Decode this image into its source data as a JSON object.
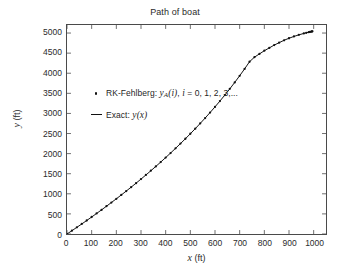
{
  "chart_data": {
    "type": "line",
    "title": "Path of boat",
    "xlabel": "x (ft)",
    "ylabel": "y (ft)",
    "xlabel_var": "x",
    "xlabel_unit": "(ft)",
    "ylabel_var": "y",
    "ylabel_unit": "(ft)",
    "xlim": [
      0,
      1050
    ],
    "ylim": [
      0,
      5200
    ],
    "grid": false,
    "legend_position": "center-left",
    "xticks": [
      0,
      100,
      200,
      300,
      400,
      500,
      600,
      700,
      800,
      900,
      1000
    ],
    "yticks": [
      0,
      500,
      1000,
      1500,
      2000,
      2500,
      3000,
      3500,
      4000,
      4500,
      5000
    ],
    "xtick_labels": [
      "0",
      "100",
      "200",
      "300",
      "400",
      "500",
      "600",
      "700",
      "800",
      "900",
      "1000"
    ],
    "ytick_labels": [
      "0",
      "500",
      "1000",
      "1500",
      "2000",
      "2500",
      "3000",
      "3500",
      "4000",
      "4500",
      "5000"
    ],
    "series": [
      {
        "name": "RK-Fehlberg",
        "legend_label_plain": "RK-Fehlberg: yA(i), i = 0, 1, 2, 3,...",
        "marker": "dot",
        "color": "#111111",
        "x": [
          0,
          20,
          40,
          60,
          80,
          100,
          120,
          140,
          160,
          180,
          200,
          220,
          240,
          260,
          280,
          300,
          320,
          340,
          360,
          380,
          400,
          420,
          440,
          460,
          480,
          500,
          520,
          540,
          560,
          580,
          600,
          620,
          640,
          660,
          680,
          700,
          720,
          740,
          760,
          780,
          800,
          820,
          840,
          860,
          880,
          900,
          920,
          940,
          960,
          970,
          980,
          985,
          990,
          993,
          995
        ],
        "y": [
          0,
          82,
          166,
          250,
          336,
          423,
          511,
          600,
          691,
          783,
          876,
          971,
          1067,
          1165,
          1265,
          1366,
          1469,
          1574,
          1681,
          1790,
          1901,
          2015,
          2131,
          2249,
          2370,
          2494,
          2621,
          2751,
          2885,
          3022,
          3163,
          3308,
          3458,
          3612,
          3772,
          3937,
          4108,
          4286,
          4400,
          4480,
          4560,
          4630,
          4700,
          4760,
          4820,
          4870,
          4915,
          4955,
          4990,
          5005,
          5020,
          5028,
          5035,
          5039,
          5042
        ]
      },
      {
        "name": "Exact",
        "legend_label_plain": "Exact: y(x)",
        "marker": "line",
        "color": "#111111"
      }
    ]
  },
  "legend": {
    "row1": {
      "prefix": "RK-Fehlberg: ",
      "var": "y",
      "sub": "A",
      "arg": "(i)",
      "comma": ", ",
      "index_var": "i",
      "index_values": " = 0, 1, 2, 3,..."
    },
    "row2": {
      "prefix": "Exact: ",
      "var": "y",
      "arg": "(x)"
    }
  }
}
